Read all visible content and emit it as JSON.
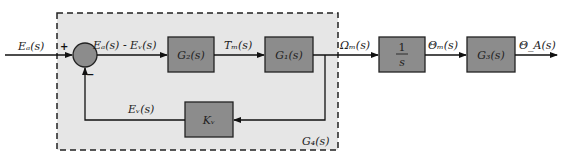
{
  "diagram": {
    "type": "control-block-diagram",
    "colors": {
      "block_fill": "#8c8c8c",
      "subsystem_fill": "#e6e6e6",
      "line": "#111111",
      "junction_fill": "#8c8c8c"
    },
    "subsystem": {
      "label": "G_4(s)",
      "display": "G₄(s)"
    },
    "summing_junction": {
      "plus": "+",
      "minus": "−"
    },
    "blocks": [
      {
        "id": "G2",
        "label": "G₂(s)"
      },
      {
        "id": "G1",
        "label": "G₁(s)"
      },
      {
        "id": "Kv",
        "label": "Kᵥ"
      },
      {
        "id": "integrator",
        "numerator": "1",
        "denominator": "s"
      },
      {
        "id": "G3",
        "label": "G₃(s)"
      }
    ],
    "signals": {
      "input": "Eₐ(s)",
      "error": "Eₐ(s) - Eᵥ(s)",
      "torque": "Tₘ(s)",
      "speed": "Ωₘ(s)",
      "motor_angle": "Θₘ(s)",
      "output": "Θ_A(s)",
      "feedback": "Eᵥ(s)"
    }
  }
}
